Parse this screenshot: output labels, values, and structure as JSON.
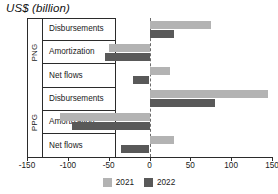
{
  "chart_data": {
    "type": "bar",
    "orientation": "horizontal",
    "title": "US$ (billion)",
    "xlabel": "",
    "ylabel": "",
    "xlim": [
      -150,
      150
    ],
    "xticks": [
      -150,
      -100,
      -50,
      0,
      50,
      100,
      150
    ],
    "xtick_labels": [
      "-150",
      "-100",
      "-50",
      "0",
      "50",
      "100",
      "150"
    ],
    "grid": false,
    "zero_line": true,
    "legend_position": "bottom",
    "groups": [
      {
        "name": "PNG",
        "categories": [
          "Disbursements",
          "Amortization",
          "Net flows"
        ]
      },
      {
        "name": "PPG",
        "categories": [
          "Disbursements",
          "Amortization",
          "Net flows"
        ]
      }
    ],
    "categories": [
      "PNG - Disbursements",
      "PNG - Amortization",
      "PNG - Net flows",
      "PPG - Disbursements",
      "PPG - Amortization",
      "PPG - Net flows"
    ],
    "series": [
      {
        "name": "2021",
        "color": "#b3b3b3",
        "values": [
          75,
          -50,
          25,
          145,
          -110,
          30
        ]
      },
      {
        "name": "2022",
        "color": "#595959",
        "values": [
          30,
          -55,
          -20,
          80,
          -95,
          -35
        ]
      }
    ]
  },
  "legend": {
    "items": [
      {
        "label": "2021",
        "color": "#b3b3b3"
      },
      {
        "label": "2022",
        "color": "#595959"
      }
    ]
  },
  "colors": {
    "series_2021": "#b3b3b3",
    "series_2022": "#595959",
    "axis": "#2b2b2b",
    "zero_line": "#6b6b6b",
    "background": "#ffffff"
  }
}
